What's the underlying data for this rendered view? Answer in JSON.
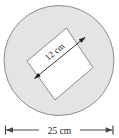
{
  "figure": {
    "kind": "geometry-diagram",
    "background_color": "#ffffff",
    "circle": {
      "name": "outer-circle",
      "fill_color": "#e4e4e4",
      "stroke_color": "#888888",
      "center_x": 59,
      "center_y": 60.5,
      "radius": 55.5
    },
    "square": {
      "name": "inscribed-square",
      "fill_color": "#ffffff",
      "stroke_color": "#8a8a8a",
      "rotation_deg": -39,
      "corners": [
        {
          "x": 27,
          "y": 61
        },
        {
          "x": 66.5,
          "y": 28
        },
        {
          "x": 93,
          "y": 67.5
        },
        {
          "x": 55,
          "y": 100
        }
      ]
    },
    "inner_dimension": {
      "name": "square-side-dimension",
      "label": "12 cm",
      "value": 12,
      "unit": "cm",
      "arrow_color": "#1a1a1a",
      "text_rotation_deg": -39,
      "from": {
        "x": 34,
        "y": 79
      },
      "to": {
        "x": 85.5,
        "y": 37
      }
    },
    "bottom_dimension": {
      "name": "circle-diameter-dimension",
      "label": "25 cm",
      "value": 25,
      "unit": "cm",
      "line_color": "#4d4d4d",
      "y": 130,
      "left_x": 5,
      "right_x": 113,
      "tick_half_height": 5
    }
  }
}
